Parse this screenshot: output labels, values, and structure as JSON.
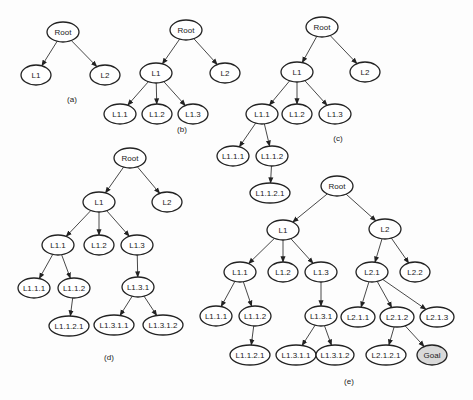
{
  "figure": {
    "panels": [
      {
        "id": "a",
        "label": "(a)",
        "label_pos": [
          72,
          102
        ],
        "nodes": [
          {
            "id": "Root",
            "label": "Root",
            "x": 63,
            "y": 32,
            "rx": 16
          },
          {
            "id": "L1",
            "label": "L1",
            "x": 36,
            "y": 75,
            "rx": 15
          },
          {
            "id": "L2",
            "label": "L2",
            "x": 105,
            "y": 75,
            "rx": 15
          }
        ],
        "edges": [
          [
            "Root",
            "L1"
          ],
          [
            "Root",
            "L2"
          ]
        ]
      },
      {
        "id": "b",
        "label": "(b)",
        "label_pos": [
          182,
          132
        ],
        "nodes": [
          {
            "id": "Root",
            "label": "Root",
            "x": 186,
            "y": 30,
            "rx": 16
          },
          {
            "id": "L1",
            "label": "L1",
            "x": 156,
            "y": 73,
            "rx": 16
          },
          {
            "id": "L2",
            "label": "L2",
            "x": 225,
            "y": 73,
            "rx": 15
          },
          {
            "id": "L1.1",
            "label": "L1.1",
            "x": 120,
            "y": 114,
            "rx": 16
          },
          {
            "id": "L1.2",
            "label": "L1.2",
            "x": 157,
            "y": 114,
            "rx": 15
          },
          {
            "id": "L1.3",
            "label": "L1.3",
            "x": 193,
            "y": 114,
            "rx": 15
          }
        ],
        "edges": [
          [
            "Root",
            "L1"
          ],
          [
            "Root",
            "L2"
          ],
          [
            "L1",
            "L1.1"
          ],
          [
            "L1",
            "L1.2"
          ],
          [
            "L1",
            "L1.3"
          ]
        ]
      },
      {
        "id": "c",
        "label": "(c)",
        "label_pos": [
          338,
          141
        ],
        "nodes": [
          {
            "id": "Root",
            "label": "Root",
            "x": 322,
            "y": 27,
            "rx": 16
          },
          {
            "id": "L1",
            "label": "L1",
            "x": 297,
            "y": 72,
            "rx": 16
          },
          {
            "id": "L2",
            "label": "L2",
            "x": 365,
            "y": 72,
            "rx": 15
          },
          {
            "id": "L1.1",
            "label": "L1.1",
            "x": 262,
            "y": 114,
            "rx": 16
          },
          {
            "id": "L1.2",
            "label": "L1.2",
            "x": 297,
            "y": 114,
            "rx": 15
          },
          {
            "id": "L1.3",
            "label": "L1.3",
            "x": 335,
            "y": 114,
            "rx": 16
          },
          {
            "id": "L1.1.1",
            "label": "L1.1.1",
            "x": 233,
            "y": 156,
            "rx": 16
          },
          {
            "id": "L1.1.2",
            "label": "L1.1.2",
            "x": 272,
            "y": 156,
            "rx": 16
          },
          {
            "id": "L1.1.2.1",
            "label": "L1.1.2.1",
            "x": 270,
            "y": 193,
            "rx": 20
          }
        ],
        "edges": [
          [
            "Root",
            "L1"
          ],
          [
            "Root",
            "L2"
          ],
          [
            "L1",
            "L1.1"
          ],
          [
            "L1",
            "L1.2"
          ],
          [
            "L1",
            "L1.3"
          ],
          [
            "L1.1",
            "L1.1.1"
          ],
          [
            "L1.1",
            "L1.1.2"
          ],
          [
            "L1.1.2",
            "L1.1.2.1"
          ]
        ]
      },
      {
        "id": "d",
        "label": "(d)",
        "label_pos": [
          109,
          360
        ],
        "nodes": [
          {
            "id": "Root",
            "label": "Root",
            "x": 130,
            "y": 158,
            "rx": 16
          },
          {
            "id": "L1",
            "label": "L1",
            "x": 99,
            "y": 202,
            "rx": 16
          },
          {
            "id": "L2",
            "label": "L2",
            "x": 167,
            "y": 202,
            "rx": 15
          },
          {
            "id": "L1.1",
            "label": "L1.1",
            "x": 58,
            "y": 245,
            "rx": 16
          },
          {
            "id": "L1.2",
            "label": "L1.2",
            "x": 99,
            "y": 245,
            "rx": 15
          },
          {
            "id": "L1.3",
            "label": "L1.3",
            "x": 137,
            "y": 245,
            "rx": 16
          },
          {
            "id": "L1.1.1",
            "label": "L1.1.1",
            "x": 34,
            "y": 288,
            "rx": 16
          },
          {
            "id": "L1.1.2",
            "label": "L1.1.2",
            "x": 74,
            "y": 288,
            "rx": 16
          },
          {
            "id": "L1.3.1",
            "label": "L1.3.1",
            "x": 138,
            "y": 287,
            "rx": 16
          },
          {
            "id": "L1.1.2.1",
            "label": "L1.1.2.1",
            "x": 69,
            "y": 326,
            "rx": 20
          },
          {
            "id": "L1.3.1.1",
            "label": "L1.3.1.1",
            "x": 114,
            "y": 325,
            "rx": 20
          },
          {
            "id": "L1.3.1.2",
            "label": "L1.3.1.2",
            "x": 163,
            "y": 325,
            "rx": 20
          }
        ],
        "edges": [
          [
            "Root",
            "L1"
          ],
          [
            "Root",
            "L2"
          ],
          [
            "L1",
            "L1.1"
          ],
          [
            "L1",
            "L1.2"
          ],
          [
            "L1",
            "L1.3"
          ],
          [
            "L1.1",
            "L1.1.1"
          ],
          [
            "L1.1",
            "L1.1.2"
          ],
          [
            "L1.1.2",
            "L1.1.2.1"
          ],
          [
            "L1.3",
            "L1.3.1"
          ],
          [
            "L1.3.1",
            "L1.3.1.1"
          ],
          [
            "L1.3.1",
            "L1.3.1.2"
          ]
        ]
      },
      {
        "id": "e",
        "label": "(e)",
        "label_pos": [
          349,
          384
        ],
        "nodes": [
          {
            "id": "Root",
            "label": "Root",
            "x": 337,
            "y": 186,
            "rx": 16
          },
          {
            "id": "L1",
            "label": "L1",
            "x": 283,
            "y": 230,
            "rx": 16
          },
          {
            "id": "L2",
            "label": "L2",
            "x": 385,
            "y": 229,
            "rx": 16
          },
          {
            "id": "L1.1",
            "label": "L1.1",
            "x": 240,
            "y": 272,
            "rx": 16
          },
          {
            "id": "L1.2",
            "label": "L1.2",
            "x": 283,
            "y": 272,
            "rx": 15
          },
          {
            "id": "L1.3",
            "label": "L1.3",
            "x": 321,
            "y": 272,
            "rx": 16
          },
          {
            "id": "L2.1",
            "label": "L2.1",
            "x": 372,
            "y": 272,
            "rx": 16
          },
          {
            "id": "L2.2",
            "label": "L2.2",
            "x": 415,
            "y": 272,
            "rx": 15
          },
          {
            "id": "L1.1.1",
            "label": "L1.1.1",
            "x": 216,
            "y": 316,
            "rx": 16
          },
          {
            "id": "L1.1.2",
            "label": "L1.1.2",
            "x": 255,
            "y": 316,
            "rx": 16
          },
          {
            "id": "L1.3.1",
            "label": "L1.3.1",
            "x": 321,
            "y": 316,
            "rx": 16
          },
          {
            "id": "L2.1.1",
            "label": "L2.1.1",
            "x": 358,
            "y": 317,
            "rx": 17
          },
          {
            "id": "L2.1.2",
            "label": "L2.1.2",
            "x": 397,
            "y": 317,
            "rx": 17
          },
          {
            "id": "L2.1.3",
            "label": "L2.1.3",
            "x": 437,
            "y": 317,
            "rx": 17
          },
          {
            "id": "L1.1.2.1",
            "label": "L1.1.2.1",
            "x": 250,
            "y": 355,
            "rx": 20
          },
          {
            "id": "L1.3.1.1",
            "label": "L1.3.1.1",
            "x": 296,
            "y": 355,
            "rx": 20
          },
          {
            "id": "L1.3.1.2",
            "label": "L1.3.1.2",
            "x": 335,
            "y": 355,
            "rx": 19
          },
          {
            "id": "L2.1.2.1",
            "label": "L2.1.2.1",
            "x": 386,
            "y": 355,
            "rx": 20
          },
          {
            "id": "Goal",
            "label": "Goal",
            "x": 432,
            "y": 355,
            "rx": 15,
            "highlight": true
          }
        ],
        "edges": [
          [
            "Root",
            "L1"
          ],
          [
            "Root",
            "L2"
          ],
          [
            "L1",
            "L1.1"
          ],
          [
            "L1",
            "L1.2"
          ],
          [
            "L1",
            "L1.3"
          ],
          [
            "L1.1",
            "L1.1.1"
          ],
          [
            "L1.1",
            "L1.1.2"
          ],
          [
            "L1.1.2",
            "L1.1.2.1"
          ],
          [
            "L1.3",
            "L1.3.1"
          ],
          [
            "L1.3.1",
            "L1.3.1.1"
          ],
          [
            "L1.3.1",
            "L1.3.1.2"
          ],
          [
            "L2",
            "L2.1"
          ],
          [
            "L2",
            "L2.2"
          ],
          [
            "L2.1",
            "L2.1.1"
          ],
          [
            "L2.1",
            "L2.1.2"
          ],
          [
            "L2.1",
            "L2.1.3"
          ],
          [
            "L2.1.2",
            "L2.1.2.1"
          ],
          [
            "L2.1.2",
            "Goal"
          ]
        ]
      }
    ],
    "colors": {
      "stroke": "#222222",
      "node_fill": "#ffffff",
      "goal_fill": "#d9d9d9",
      "background": "#fdfdfd"
    }
  }
}
